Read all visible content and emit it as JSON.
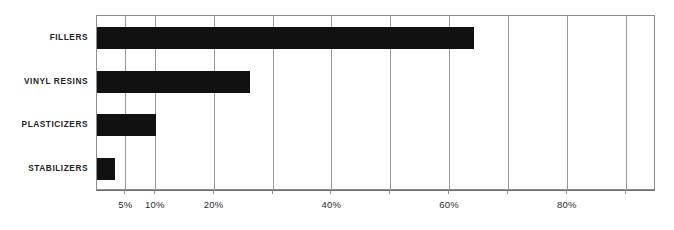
{
  "chart_data": {
    "type": "bar",
    "orientation": "horizontal",
    "title": "",
    "subtitle": "",
    "xlabel": "",
    "ylabel": "",
    "categories": [
      "FILLERS",
      "VINYL RESINS",
      "PLASTICIZERS",
      "STABILIZERS"
    ],
    "values": [
      64,
      26,
      10,
      3
    ],
    "value_unit": "%",
    "xlim": [
      0,
      95
    ],
    "ylim": null,
    "grid": true,
    "grid_axis": "x",
    "legend": null,
    "legend_position": "none",
    "annotations": [],
    "xticks": [
      {
        "value": 5,
        "label": "5%"
      },
      {
        "value": 10,
        "label": "10%"
      },
      {
        "value": 20,
        "label": "20%"
      },
      {
        "value": 30,
        "label": ""
      },
      {
        "value": 40,
        "label": "40%"
      },
      {
        "value": 50,
        "label": ""
      },
      {
        "value": 60,
        "label": "60%"
      },
      {
        "value": 70,
        "label": ""
      },
      {
        "value": 80,
        "label": "80%"
      },
      {
        "value": 90,
        "label": ""
      }
    ],
    "series": [
      {
        "name": "Share",
        "values": [
          64,
          26,
          10,
          3
        ]
      }
    ],
    "colors": {
      "bar": "#111111",
      "grid": "#9a9a9a",
      "axis": "#8d8d8d",
      "text": "#232323",
      "background": "#ffffff"
    }
  }
}
